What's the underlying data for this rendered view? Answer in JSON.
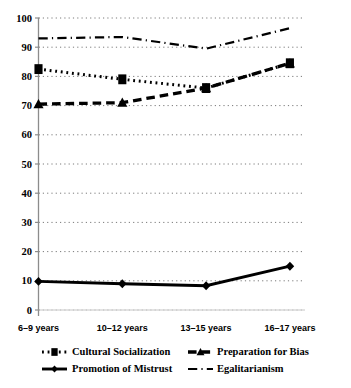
{
  "chart_data": {
    "type": "line",
    "title": "",
    "xlabel": "",
    "ylabel": "",
    "categories": [
      "6–9 years",
      "10–12 years",
      "13–15 years",
      "16–17 years"
    ],
    "ylim": [
      0,
      100
    ],
    "yticks": [
      0,
      10,
      20,
      30,
      40,
      50,
      60,
      70,
      80,
      90,
      100
    ],
    "ytick_labels": [
      "0",
      "10",
      "20",
      "30",
      "40",
      "50",
      "60",
      "70",
      "80",
      "90",
      "100"
    ],
    "grid": true,
    "grid_style": "dotted-horizontal",
    "legend_position": "bottom",
    "series": [
      {
        "name": "Cultural Socialization",
        "values": [
          82.5,
          79.0,
          76.0,
          84.5
        ],
        "line_style": "dotted",
        "marker": "square",
        "color": "#000000"
      },
      {
        "name": "Preparation for Bias",
        "values": [
          70.5,
          71.0,
          76.0,
          84.5
        ],
        "line_style": "dashed",
        "marker": "triangle",
        "color": "#000000"
      },
      {
        "name": "Promotion of Mistrust",
        "values": [
          9.8,
          9.0,
          8.3,
          15.0
        ],
        "line_style": "solid",
        "marker": "diamond",
        "color": "#000000"
      },
      {
        "name": "Egalitarianism",
        "values": [
          93.0,
          93.5,
          89.5,
          96.5
        ],
        "line_style": "dash-dot",
        "marker": "none",
        "color": "#000000"
      }
    ]
  },
  "legend": {
    "entries": [
      {
        "label": "Cultural Socialization",
        "marker": "square",
        "style": "dotted"
      },
      {
        "label": "Preparation for Bias",
        "marker": "triangle",
        "style": "dashed"
      },
      {
        "label": "Promotion of Mistrust",
        "marker": "diamond",
        "style": "solid"
      },
      {
        "label": "Egalitarianism",
        "marker": "none",
        "style": "dash-dot"
      }
    ]
  },
  "axes": {
    "y_tick_labels": [
      "100",
      "90",
      "80",
      "70",
      "60",
      "50",
      "40",
      "30",
      "20",
      "10",
      "0"
    ],
    "x_tick_labels": [
      "6–9 years",
      "10–12 years",
      "13–15 years",
      "16–17 years"
    ]
  },
  "colors": {
    "ink": "#000000",
    "grid": "#7a7a7a",
    "axis": "#8c8c8c",
    "background": "#ffffff"
  }
}
